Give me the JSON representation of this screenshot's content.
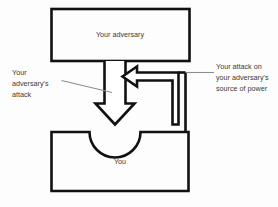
{
  "diagram": {
    "background_color": "#fdfdfd",
    "stroke_color": "#111111",
    "text_color": "#3a3a3a",
    "leader_color": "#8d8d8d",
    "boxes": [
      {
        "id": "adversary",
        "label": "Your adversary"
      },
      {
        "id": "you",
        "label": "You"
      }
    ],
    "annotations": [
      {
        "id": "adversary-attack",
        "position": "left",
        "lines": [
          "Your",
          "adversary's",
          "attack"
        ],
        "full_text": "Your adversary's attack"
      },
      {
        "id": "your-attack",
        "position": "right",
        "lines": [
          "Your attack on",
          "your adversary's",
          "source of power"
        ],
        "full_text": "Your attack on your adversary's source of power"
      }
    ],
    "arrows": [
      {
        "id": "down-arrow",
        "direction": "down",
        "semantic": "adversary attacks you"
      },
      {
        "id": "left-hook-arrow",
        "direction": "left",
        "semantic": "you attack adversary source of power"
      }
    ]
  }
}
